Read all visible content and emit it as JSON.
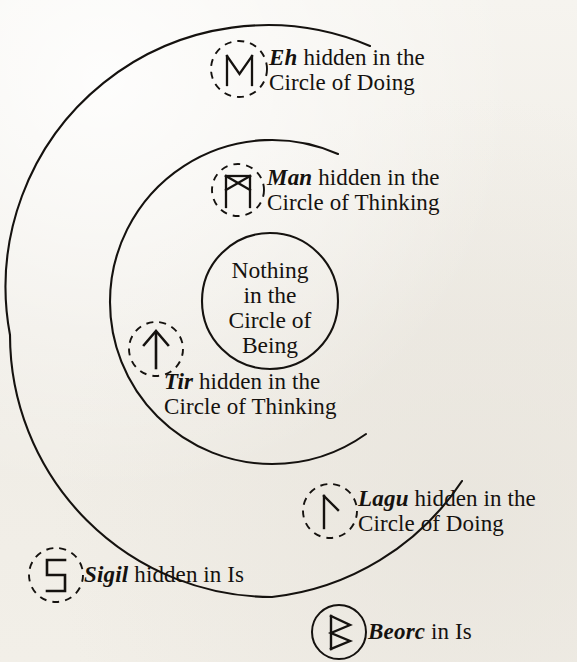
{
  "diagram": {
    "center_circle_text": [
      "Nothing",
      "in the",
      "Circle of",
      "Being"
    ],
    "rings": [
      {
        "name": "outer-ring",
        "label": "Circle of Doing"
      },
      {
        "name": "middle-ring",
        "label": "Circle of Thinking"
      },
      {
        "name": "inner-ring",
        "label": "Circle of Being"
      }
    ],
    "annotations": [
      {
        "id": "eh",
        "rune_name": "Eh",
        "rune_glyph": "eh-rune",
        "line1": " hidden in the",
        "line2": "Circle of Doing",
        "circle_style": "dashed"
      },
      {
        "id": "man",
        "rune_name": "Man",
        "rune_glyph": "man-rune",
        "line1": " hidden in the",
        "line2": "Circle of Thinking",
        "circle_style": "dashed"
      },
      {
        "id": "tir",
        "rune_name": "Tir",
        "rune_glyph": "tir-rune",
        "line1": " hidden in the",
        "line2": "Circle of Thinking",
        "circle_style": "dashed"
      },
      {
        "id": "lagu",
        "rune_name": "Lagu",
        "rune_glyph": "lagu-rune",
        "line1": " hidden in the",
        "line2": "Circle of Doing",
        "circle_style": "dashed"
      },
      {
        "id": "sigil",
        "rune_name": "Sigil",
        "rune_glyph": "sigil-rune",
        "line1": " hidden in Is",
        "line2": "",
        "circle_style": "dashed"
      },
      {
        "id": "beorc",
        "rune_name": "Beorc",
        "rune_glyph": "beorc-rune",
        "line1": " in Is",
        "line2": "",
        "circle_style": "solid"
      }
    ],
    "colors": {
      "ink": "#15120f",
      "paper": "#f3f1ec"
    }
  }
}
